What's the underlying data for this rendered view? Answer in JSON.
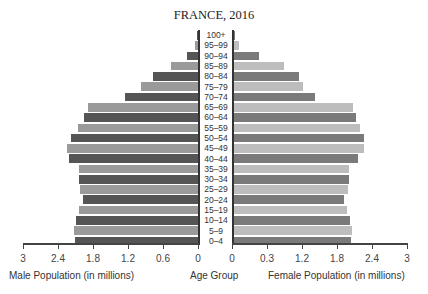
{
  "chart_data": {
    "type": "bar",
    "subtype": "population-pyramid",
    "title": "FRANCE, 2016",
    "categories": [
      "100+",
      "95–99",
      "90–94",
      "85–89",
      "80–84",
      "75–79",
      "70–74",
      "65–69",
      "60–64",
      "55–59",
      "50–54",
      "45–49",
      "40–44",
      "35–39",
      "30–34",
      "25–29",
      "20–24",
      "15–19",
      "10–14",
      "5–9",
      "0–4"
    ],
    "series": [
      {
        "name": "Male Population (in millions)",
        "values": [
          0.02,
          0.05,
          0.19,
          0.47,
          0.78,
          0.98,
          1.26,
          1.9,
          1.97,
          2.07,
          2.19,
          2.26,
          2.22,
          2.05,
          2.05,
          2.03,
          1.98,
          2.05,
          2.1,
          2.14,
          2.12
        ]
      },
      {
        "name": "Female Population (in millions)",
        "values": [
          0.02,
          0.1,
          0.45,
          0.88,
          1.14,
          1.21,
          1.41,
          2.07,
          2.12,
          2.19,
          2.26,
          2.26,
          2.16,
          2.0,
          2.0,
          1.98,
          1.91,
          1.97,
          2.02,
          2.05,
          2.03
        ]
      }
    ],
    "xlabel_left": "Male Population (in millions)",
    "xlabel_center": "Age Group",
    "xlabel_right": "Female Population (in millions)",
    "left_ticks": [
      "3",
      "2.4",
      "1.8",
      "1.2",
      "0.6",
      "0"
    ],
    "right_ticks": [
      "0",
      "0.3",
      "1.2",
      "1.8",
      "2.4",
      "3"
    ],
    "xlim": [
      0,
      3
    ],
    "grid": false,
    "legend": "none"
  },
  "colors": {
    "male_dark": "#555555",
    "male_light": "#9a9a9a",
    "female_dark": "#7a7a7a",
    "female_light": "#bdbdbd"
  }
}
